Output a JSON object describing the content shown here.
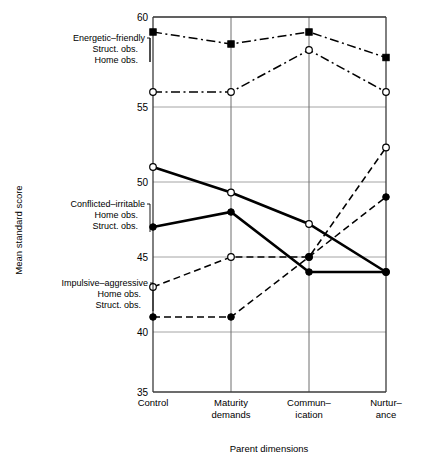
{
  "chart_data": {
    "type": "line",
    "title": "",
    "xlabel": "Parent dimensions",
    "ylabel": "Mean standard score",
    "categories": [
      "Control",
      "Maturity demands",
      "Communication",
      "Nurturance"
    ],
    "category_lines": [
      [
        "Control",
        ""
      ],
      [
        "Maturity",
        "demands"
      ],
      [
        "Commun–",
        "ication"
      ],
      [
        "Nurtur–",
        "ance"
      ]
    ],
    "ylim": [
      35,
      60
    ],
    "yticks": [
      35,
      40,
      45,
      50,
      55,
      60
    ],
    "ytick_labels": [
      "35",
      "40",
      "45",
      "50",
      "55",
      "60"
    ],
    "grid": true,
    "legend_position": "left-inline",
    "series": [
      {
        "name": "Energetic–friendly Struct. obs.",
        "group": "Energetic–friendly",
        "observation": "Struct. obs.",
        "marker": "filled-square",
        "line_style": "dash-dot",
        "line_width": "thin",
        "values": [
          59.0,
          58.2,
          59.0,
          57.3
        ]
      },
      {
        "name": "Energetic–friendly Home obs.",
        "group": "Energetic–friendly",
        "observation": "Home obs.",
        "marker": "open-circle",
        "line_style": "dash-dot",
        "line_width": "thin",
        "values": [
          55.0,
          55.0,
          57.8,
          55.0
        ]
      },
      {
        "name": "Conflicted–irritable Home obs.",
        "group": "Conflicted–irritable",
        "observation": "Home obs.",
        "marker": "open-circle",
        "line_style": "solid",
        "line_width": "thick",
        "values": [
          50.0,
          48.3,
          46.2,
          43.0
        ]
      },
      {
        "name": "Conflicted–irritable Struct. obs.",
        "group": "Conflicted–irritable",
        "observation": "Struct. obs.",
        "marker": "filled-circle",
        "line_style": "solid",
        "line_width": "thick",
        "values": [
          46.0,
          47.0,
          43.0,
          43.0
        ]
      },
      {
        "name": "Impulsive–aggressive Home obs.",
        "group": "Impulsive–aggressive",
        "observation": "Home obs.",
        "marker": "open-circle",
        "line_style": "dashed",
        "line_width": "thin",
        "values": [
          42.0,
          44.0,
          44.0,
          51.3
        ]
      },
      {
        "name": "Impulsive–aggressive Struct. obs.",
        "group": "Impulsive–aggressive",
        "observation": "Struct. obs.",
        "marker": "filled-circle",
        "line_style": "dashed",
        "line_width": "thin",
        "values": [
          40.0,
          40.0,
          44.0,
          48.0
        ]
      }
    ]
  },
  "legend": {
    "blocks": [
      {
        "id": "energetic",
        "title": "Energetic–friendly",
        "line1": "Struct. obs.",
        "line2": "Home obs."
      },
      {
        "id": "conflicted",
        "title": "Conflicted–irritable",
        "line1": "Home obs.",
        "line2": "Struct. obs."
      },
      {
        "id": "impulsive",
        "title": "Impulsive–aggressive",
        "line1": "Home obs.",
        "line2": "Struct. obs."
      }
    ]
  },
  "axes": {
    "y_title": "Mean standard score",
    "x_title": "Parent dimensions",
    "y_ticks": [
      "60",
      "55",
      "50",
      "45",
      "40",
      "35"
    ],
    "x_cat_1_line1": "Control",
    "x_cat_1_line2": "",
    "x_cat_2_line1": "Maturity",
    "x_cat_2_line2": "demands",
    "x_cat_3_line1": "Commun–",
    "x_cat_3_line2": "ication",
    "x_cat_4_line1": "Nurtur–",
    "x_cat_4_line2": "ance"
  },
  "colors": {
    "ink": "#000000",
    "grid": "#9a9a9a",
    "frame": "#3b3b3b",
    "background": "#ffffff"
  }
}
